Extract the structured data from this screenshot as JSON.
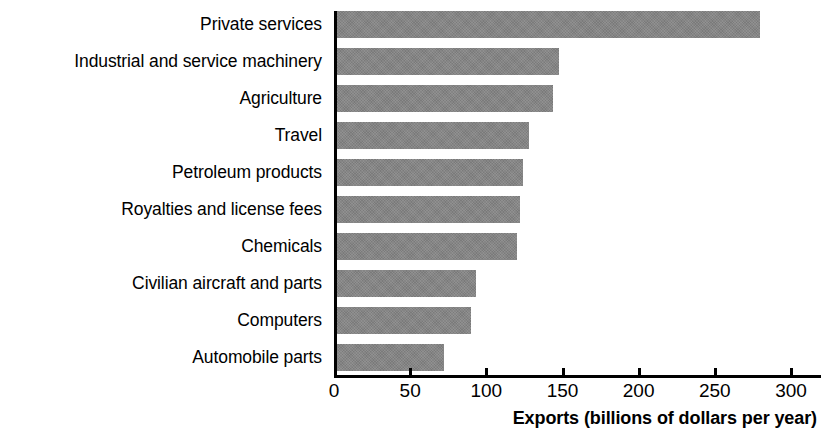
{
  "chart_data": {
    "type": "bar",
    "orientation": "horizontal",
    "title": "",
    "xlabel": "Exports (billions of dollars per year)",
    "ylabel": "",
    "xlim": [
      0,
      300
    ],
    "grid": false,
    "legend": false,
    "bar_color": "#848484",
    "axis_color": "#000000",
    "background_color": "#ffffff",
    "xticks": [
      "0",
      "50",
      "100",
      "150",
      "200",
      "250",
      "300"
    ],
    "xtick_values": [
      0,
      50,
      100,
      150,
      200,
      250,
      300
    ],
    "categories": [
      "Private services",
      "Industrial and service machinery",
      "Agriculture",
      "Travel",
      "Petroleum products",
      "Royalties and license fees",
      "Chemicals",
      "Civilian aircraft and parts",
      "Computers",
      "Automobile parts"
    ],
    "values": [
      278,
      146,
      142,
      126,
      122,
      120,
      118,
      91,
      88,
      70
    ]
  }
}
